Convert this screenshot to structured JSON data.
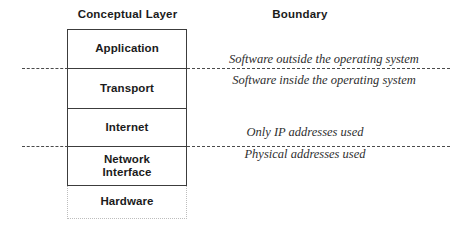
{
  "headings": {
    "conceptual": "Conceptual Layer",
    "boundary": "Boundary"
  },
  "layers": [
    {
      "label": "Application",
      "style": "solid"
    },
    {
      "label": "Transport",
      "style": "solid"
    },
    {
      "label": "Internet",
      "style": "solid"
    },
    {
      "label": "Network\nInterface",
      "style": "solid"
    },
    {
      "label": "Hardware",
      "style": "dotted"
    }
  ],
  "layer_names": {
    "application": "Application",
    "transport": "Transport",
    "internet": "Internet",
    "network_interface": "Network\nInterface",
    "hardware": "Hardware"
  },
  "boundaries": [
    {
      "above": "Software outside the operating system",
      "below": "Software inside the operating system"
    },
    {
      "above": "Only IP addresses used",
      "below": "Physical addresses used"
    }
  ],
  "notes": {
    "software_outside": "Software outside the operating system",
    "software_inside": "Software inside the operating system",
    "only_ip": "Only IP addresses used",
    "physical_addresses": "Physical addresses used"
  },
  "colors": {
    "background": "#ffffff",
    "box_border": "#3c3c3c",
    "dotted_border": "#bdbdbd",
    "dashed_rule": "#4a4a4a",
    "text": "#1b1b1b",
    "note_text": "#2e2e2e"
  }
}
